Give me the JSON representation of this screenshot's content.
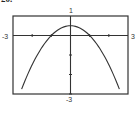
{
  "problem": {
    "number": "20."
  },
  "chart_data": {
    "type": "line",
    "title": "",
    "xlabel": "",
    "ylabel": "",
    "xlim": [
      -3,
      3
    ],
    "ylim": [
      -3,
      1
    ],
    "window_labels": {
      "xmin": "-3",
      "xmax": "3",
      "ymin": "-3",
      "ymax": "1"
    },
    "x_ticks": [
      -2,
      -1,
      0,
      1,
      2
    ],
    "y_ticks": [
      -3,
      -2,
      -1,
      0
    ],
    "grid": false,
    "series": [
      {
        "name": "y = (1 - x^2)/2",
        "x": [
          -2.55,
          -2,
          -1.5,
          -1,
          -0.5,
          0,
          0.5,
          1,
          1.5,
          2,
          2.55
        ],
        "y": [
          -2.75,
          -1.5,
          -0.625,
          0,
          0.375,
          0.5,
          0.375,
          0,
          -0.625,
          -1.5,
          -2.75
        ]
      }
    ]
  }
}
